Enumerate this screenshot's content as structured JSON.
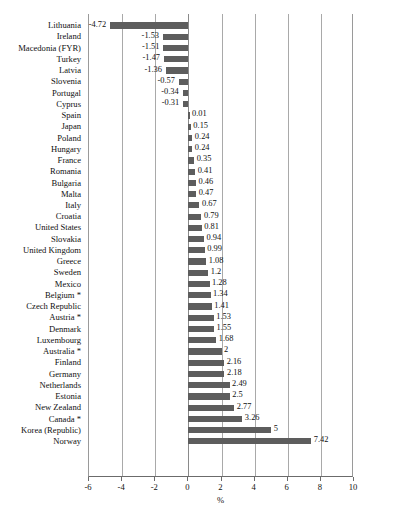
{
  "chart_data": {
    "type": "bar",
    "orientation": "horizontal",
    "title": "",
    "xlabel": "%",
    "ylabel": "",
    "xlim": [
      -6,
      10
    ],
    "xticks": [
      -6,
      -4,
      -2,
      0,
      2,
      4,
      6,
      8,
      10
    ],
    "xtick_labels": [
      "-6",
      "-4",
      "-2",
      "0",
      "2",
      "4",
      "6",
      "8",
      "10"
    ],
    "grid": true,
    "legend": "none",
    "bar_color": "#5d5d5d",
    "categories": [
      "Lithuania",
      "Ireland",
      "Macedonia (FYR)",
      "Turkey",
      "Latvia",
      "Slovenia",
      "Portugal",
      "Cyprus",
      "Spain",
      "Japan",
      "Poland",
      "Hungary",
      "France",
      "Romania",
      "Bulgaria",
      "Malta",
      "Italy",
      "Croatia",
      "United States",
      "Slovakia",
      "United Kingdom",
      "Greece",
      "Sweden",
      "Mexico",
      "Belgium *",
      "Czech Republic",
      "Austria *",
      "Denmark",
      "Luxembourg",
      "Australia *",
      "Finland",
      "Germany",
      "Netherlands",
      "Estonia",
      "New Zealand",
      "Canada *",
      "Korea (Republic)",
      "Norway"
    ],
    "values": [
      -4.72,
      -1.53,
      -1.51,
      -1.47,
      -1.36,
      -0.57,
      -0.34,
      -0.31,
      0.01,
      0.15,
      0.24,
      0.24,
      0.35,
      0.41,
      0.46,
      0.47,
      0.67,
      0.79,
      0.81,
      0.94,
      0.99,
      1.08,
      1.2,
      1.28,
      1.34,
      1.41,
      1.53,
      1.55,
      1.68,
      2,
      2.16,
      2.18,
      2.49,
      2.5,
      2.77,
      3.26,
      5,
      7.42
    ],
    "value_labels": [
      "-4.72",
      "-1.53",
      "-1.51",
      "-1.47",
      "-1.36",
      "-0.57",
      "-0.34",
      "-0.31",
      "0.01",
      "0.15",
      "0.24",
      "0.24",
      "0.35",
      "0.41",
      "0.46",
      "0.47",
      "0.67",
      "0.79",
      "0.81",
      "0.94",
      "0.99",
      "1.08",
      "1.2",
      "1.28",
      "1.34",
      "1.41",
      "1.53",
      "1.55",
      "1.68",
      "2",
      "2.16",
      "2.18",
      "2.49",
      "2.5",
      "2.77",
      "3.26",
      "5",
      "7.42"
    ]
  },
  "footer": {
    "source_note": ""
  }
}
